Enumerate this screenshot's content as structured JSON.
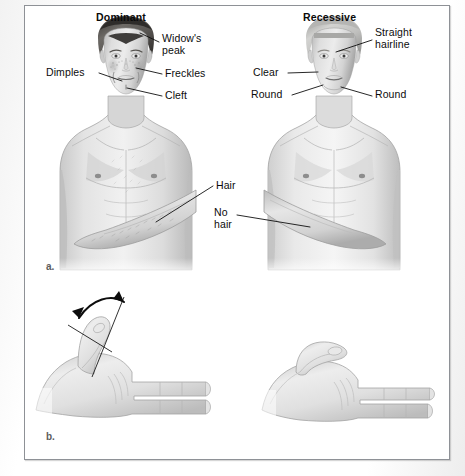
{
  "figure": {
    "background_color": "#ffffff",
    "frame_color": "#8e9196",
    "ink_color": "#0c0c0c",
    "panels": [
      {
        "letter": "a.",
        "caption": "Human inherited traits of the face and body"
      },
      {
        "letter": "b.",
        "caption": "Hitchhiker's thumb"
      }
    ]
  },
  "panel_a": {
    "left_figure": {
      "title": "Dominant",
      "labels": [
        {
          "text": "Widow's\npeak",
          "name": "widows-peak"
        },
        {
          "text": "Dimples",
          "name": "dimples"
        },
        {
          "text": "Freckles",
          "name": "freckles"
        },
        {
          "text": "Cleft",
          "name": "cleft"
        },
        {
          "text": "Hair",
          "name": "hair"
        }
      ]
    },
    "right_figure": {
      "title": "Recessive",
      "labels": [
        {
          "text": "Straight\nhairline",
          "name": "straight-hairline"
        },
        {
          "text": "Clear",
          "name": "clear"
        },
        {
          "text": "Round",
          "name": "round-chin"
        },
        {
          "text": "Round",
          "name": "round-jaw"
        },
        {
          "text": "No\nhair",
          "name": "no-hair"
        }
      ]
    },
    "letter": "a."
  },
  "panel_b": {
    "letter": "b.",
    "left_hand": {
      "name": "hitchhikers-thumb-hand",
      "has_angle_arc": true
    },
    "right_hand": {
      "name": "straight-thumb-hand",
      "has_angle_arc": false
    }
  },
  "labels": {
    "dominant_title": "Dominant",
    "recessive_title": "Recessive",
    "widows_peak_line1": "Widow's",
    "widows_peak_line2": "peak",
    "dimples": "Dimples",
    "freckles": "Freckles",
    "cleft": "Cleft",
    "hair": "Hair",
    "straight_line1": "Straight",
    "straight_line2": "hairline",
    "clear": "Clear",
    "round_left": "Round",
    "round_right": "Round",
    "no_hair_line1": "No",
    "no_hair_line2": "hair",
    "panel_a_letter": "a.",
    "panel_b_letter": "b."
  }
}
